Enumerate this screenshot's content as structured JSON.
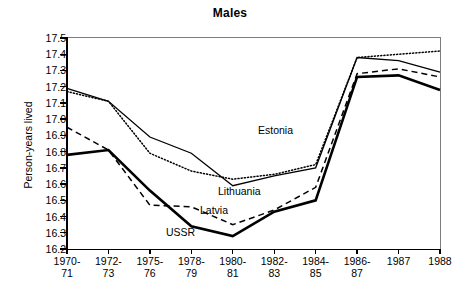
{
  "chart_data": {
    "type": "line",
    "title": "Males",
    "xlabel": "",
    "ylabel": "Person-years lived",
    "ylim": [
      16.2,
      17.5
    ],
    "ytick_labels": [
      "17.5",
      "17.4",
      "17.3",
      "17.2",
      "17.1",
      "17.0",
      "16.9",
      "16.8",
      "16.7",
      "16.6",
      "16.5",
      "16.4",
      "16.3",
      "16.2"
    ],
    "yticks": [
      17.5,
      17.4,
      17.3,
      17.2,
      17.1,
      17.0,
      16.9,
      16.8,
      16.7,
      16.6,
      16.5,
      16.4,
      16.3,
      16.2
    ],
    "grid": false,
    "legend_position": "inline-annotations",
    "categories": [
      "1970-71",
      "1972-73",
      "1975-76",
      "1978-79",
      "1980-81",
      "1982-83",
      "1984-85",
      "1986-87",
      "1987",
      "1988"
    ],
    "category_lines": [
      [
        "1970-",
        "71"
      ],
      [
        "1972-",
        "73"
      ],
      [
        "1975-",
        "76"
      ],
      [
        "1978-",
        "79"
      ],
      [
        "1980-",
        "81"
      ],
      [
        "1982-",
        "83"
      ],
      [
        "1984-",
        "85"
      ],
      [
        "1986-",
        "87"
      ],
      [
        "1987",
        ""
      ],
      [
        "1988",
        ""
      ]
    ],
    "series": [
      {
        "name": "Estonia",
        "style": "dotted",
        "values": [
          17.17,
          17.11,
          16.79,
          16.68,
          16.63,
          16.66,
          16.72,
          17.38,
          17.4,
          17.42
        ]
      },
      {
        "name": "Lithuania",
        "style": "solid",
        "values": [
          17.19,
          17.11,
          16.89,
          16.79,
          16.59,
          16.65,
          16.7,
          17.38,
          17.36,
          17.29
        ]
      },
      {
        "name": "Latvia",
        "style": "dashed",
        "values": [
          16.95,
          16.81,
          16.47,
          16.46,
          16.35,
          16.44,
          16.58,
          17.28,
          17.31,
          17.26
        ]
      },
      {
        "name": "USSR",
        "style": "bold-solid",
        "values": [
          16.78,
          16.81,
          16.56,
          16.34,
          16.28,
          16.43,
          16.5,
          17.26,
          17.27,
          17.18
        ]
      }
    ],
    "annotations": [
      {
        "text": "Estonia",
        "series": "Estonia"
      },
      {
        "text": "Lithuania",
        "series": "Lithuania"
      },
      {
        "text": "Latvia",
        "series": "Latvia"
      },
      {
        "text": "USSR",
        "series": "USSR"
      }
    ],
    "colors": {
      "line": "#000000",
      "axis": "#000000",
      "frame": "#7d7d7d",
      "background": "#ffffff"
    }
  }
}
